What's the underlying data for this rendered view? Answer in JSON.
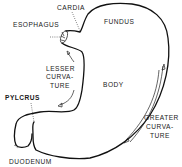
{
  "diagram": {
    "labels": {
      "cardia": "CARDIA",
      "esophagus": "ESOPHAGUS",
      "fundus": "FUNDUS",
      "lesser_curvature": [
        "LESSER",
        "CURVA-",
        "TURE"
      ],
      "body": "BODY",
      "pylorus": "PYLCRUS",
      "greater_curvature": [
        "GREATER",
        "CURVA-",
        "TURE"
      ],
      "duodenum": "DUODENUM"
    }
  }
}
